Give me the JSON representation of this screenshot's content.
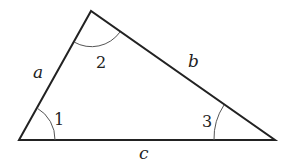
{
  "diagram": {
    "type": "triangle",
    "vertices": {
      "left": [
        19,
        140
      ],
      "top": [
        91,
        11
      ],
      "right": [
        275,
        140
      ]
    },
    "sides": [
      {
        "label": "a",
        "between": [
          "left",
          "top"
        ]
      },
      {
        "label": "b",
        "between": [
          "top",
          "right"
        ]
      },
      {
        "label": "c",
        "between": [
          "left",
          "right"
        ]
      }
    ],
    "angles": [
      {
        "label": "1",
        "vertex": "left"
      },
      {
        "label": "2",
        "vertex": "top"
      },
      {
        "label": "3",
        "vertex": "right"
      }
    ],
    "colors": {
      "stroke": "#222222",
      "arc": "#555555",
      "background": "#ffffff"
    }
  }
}
